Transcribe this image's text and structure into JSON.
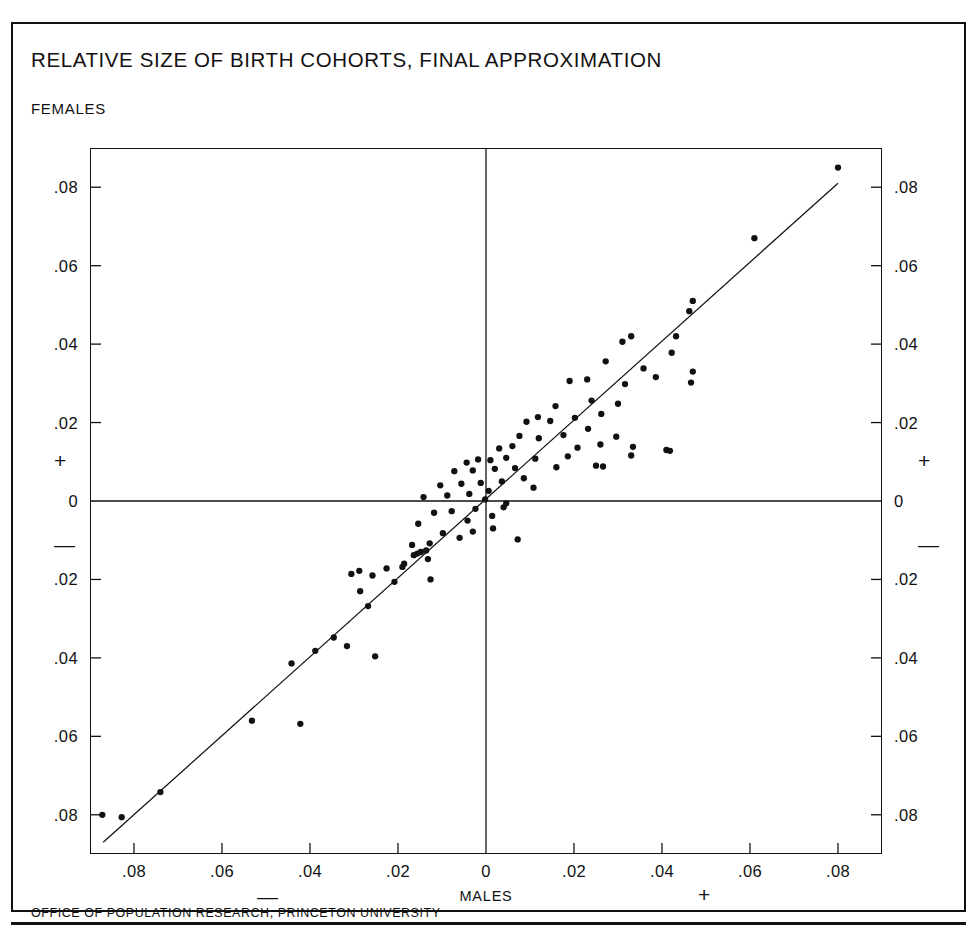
{
  "figure": {
    "title": "RELATIVE SIZE OF BIRTH COHORTS, FINAL APPROXIMATION",
    "footer": "OFFICE OF POPULATION RESEARCH, PRINCETON UNIVERSITY",
    "y_axis_name": "FEMALES",
    "x_axis_name": "MALES",
    "sign_plus": "+",
    "sign_minus": "—",
    "ink_color": "#111111",
    "background_color": "#ffffff"
  },
  "chart_data": {
    "type": "scatter",
    "title": "RELATIVE SIZE OF BIRTH COHORTS, FINAL APPROXIMATION",
    "xlabel": "MALES",
    "ylabel": "FEMALES",
    "xlim": [
      -0.09,
      0.09
    ],
    "ylim": [
      -0.09,
      0.09
    ],
    "grid": false,
    "legend": false,
    "axis_origin_lines": true,
    "x_ticks": [
      -0.08,
      -0.06,
      -0.04,
      -0.02,
      0,
      0.02,
      0.04,
      0.06,
      0.08
    ],
    "x_tick_labels": [
      ".08",
      ".06",
      ".04",
      ".02",
      "0",
      ".02",
      ".04",
      ".06",
      ".08"
    ],
    "y_ticks": [
      -0.08,
      -0.06,
      -0.04,
      -0.02,
      0,
      0.02,
      0.04,
      0.06,
      0.08
    ],
    "y_tick_labels": [
      ".08",
      ".06",
      ".04",
      ".02",
      "0",
      ".02",
      ".04",
      ".06",
      ".08"
    ],
    "x_negative_sign": "—",
    "x_positive_sign": "+",
    "y_negative_sign": "—",
    "y_positive_sign": "+",
    "reference_line": {
      "label": "identity line y = x",
      "from": [
        -0.087,
        -0.087
      ],
      "to": [
        0.08,
        0.081
      ]
    },
    "points": [
      [
        0.08,
        0.085
      ],
      [
        0.061,
        0.067
      ],
      [
        0.047,
        0.051
      ],
      [
        0.0462,
        0.0484
      ],
      [
        0.0432,
        0.042
      ],
      [
        0.033,
        0.042
      ],
      [
        0.031,
        0.0406
      ],
      [
        0.0422,
        0.0378
      ],
      [
        0.0358,
        0.0338
      ],
      [
        0.047,
        0.033
      ],
      [
        0.0386,
        0.0316
      ],
      [
        0.0466,
        0.0302
      ],
      [
        0.0316,
        0.0298
      ],
      [
        0.0272,
        0.0356
      ],
      [
        0.023,
        0.031
      ],
      [
        0.019,
        0.0306
      ],
      [
        0.024,
        0.0256
      ],
      [
        0.03,
        0.0248
      ],
      [
        0.0158,
        0.0242
      ],
      [
        0.0262,
        0.0222
      ],
      [
        0.0202,
        0.0212
      ],
      [
        0.0118,
        0.0214
      ],
      [
        0.0146,
        0.0204
      ],
      [
        0.0092,
        0.0202
      ],
      [
        0.0232,
        0.0184
      ],
      [
        0.0176,
        0.0168
      ],
      [
        0.0296,
        0.0164
      ],
      [
        0.012,
        0.016
      ],
      [
        0.0076,
        0.0166
      ],
      [
        0.026,
        0.0144
      ],
      [
        0.0334,
        0.0138
      ],
      [
        0.0208,
        0.0136
      ],
      [
        0.006,
        0.014
      ],
      [
        0.003,
        0.0134
      ],
      [
        0.041,
        0.013
      ],
      [
        0.0418,
        0.0128
      ],
      [
        0.033,
        0.0116
      ],
      [
        0.0186,
        0.0114
      ],
      [
        0.0112,
        0.0108
      ],
      [
        0.0046,
        0.011
      ],
      [
        0.001,
        0.0104
      ],
      [
        -0.0018,
        0.0106
      ],
      [
        -0.0044,
        0.0098
      ],
      [
        0.025,
        0.009
      ],
      [
        0.0266,
        0.0088
      ],
      [
        0.016,
        0.0086
      ],
      [
        0.0066,
        0.0084
      ],
      [
        0.002,
        0.0082
      ],
      [
        -0.003,
        0.0078
      ],
      [
        -0.0072,
        0.0076
      ],
      [
        0.0086,
        0.0058
      ],
      [
        0.0036,
        0.005
      ],
      [
        -0.0012,
        0.0046
      ],
      [
        -0.0056,
        0.0044
      ],
      [
        -0.0104,
        0.004
      ],
      [
        0.0108,
        0.0034
      ],
      [
        0.0006,
        0.0026
      ],
      [
        -0.0038,
        0.0018
      ],
      [
        -0.0088,
        0.0014
      ],
      [
        -0.0142,
        0.001
      ],
      [
        -0.0002,
        0.0004
      ],
      [
        0.0046,
        -0.0006
      ],
      [
        0.004,
        -0.0016
      ],
      [
        -0.0024,
        -0.002
      ],
      [
        -0.0078,
        -0.0026
      ],
      [
        -0.0118,
        -0.003
      ],
      [
        0.0014,
        -0.0038
      ],
      [
        -0.0042,
        -0.005
      ],
      [
        -0.0154,
        -0.0058
      ],
      [
        0.0016,
        -0.007
      ],
      [
        -0.003,
        -0.0078
      ],
      [
        -0.0098,
        -0.0082
      ],
      [
        -0.006,
        -0.0094
      ],
      [
        0.0072,
        -0.0098
      ],
      [
        -0.0128,
        -0.0108
      ],
      [
        -0.0168,
        -0.0112
      ],
      [
        -0.0136,
        -0.0126
      ],
      [
        -0.0148,
        -0.013
      ],
      [
        -0.0156,
        -0.0134
      ],
      [
        -0.0164,
        -0.0138
      ],
      [
        -0.0132,
        -0.0148
      ],
      [
        -0.0186,
        -0.016
      ],
      [
        -0.019,
        -0.0168
      ],
      [
        -0.0226,
        -0.0172
      ],
      [
        -0.0288,
        -0.0178
      ],
      [
        -0.0306,
        -0.0186
      ],
      [
        -0.0258,
        -0.019
      ],
      [
        -0.0208,
        -0.0206
      ],
      [
        -0.0126,
        -0.02
      ],
      [
        -0.0286,
        -0.023
      ],
      [
        -0.0268,
        -0.0268
      ],
      [
        -0.0346,
        -0.0348
      ],
      [
        -0.0316,
        -0.037
      ],
      [
        -0.0388,
        -0.0382
      ],
      [
        -0.0252,
        -0.0396
      ],
      [
        -0.0442,
        -0.0414
      ],
      [
        -0.0532,
        -0.056
      ],
      [
        -0.0422,
        -0.0568
      ],
      [
        -0.074,
        -0.0742
      ],
      [
        -0.0872,
        -0.08
      ],
      [
        -0.0828,
        -0.0806
      ]
    ]
  }
}
